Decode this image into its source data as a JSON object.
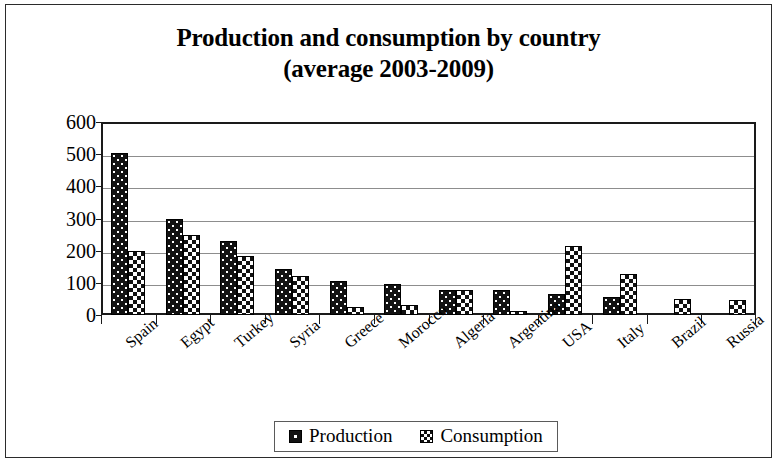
{
  "chart_data": {
    "type": "bar",
    "title": "Production and consumption by country (average 2003-2009)",
    "title_line1": "Production and consumption by country",
    "title_line2": "(average 2003-2009)",
    "xlabel": "",
    "ylabel": "000. tonn",
    "ylim": [
      0,
      600
    ],
    "ytick_values": [
      600,
      500,
      400,
      300,
      200,
      100,
      0
    ],
    "ytick_labels": [
      "600",
      "500",
      "400",
      "300",
      "200",
      "100",
      "0"
    ],
    "grid": true,
    "legend_position": "bottom",
    "categories": [
      "Spain",
      "Egypt",
      "Turkey",
      "Syria",
      "Greece",
      "Morocco",
      "Algeria",
      "Argentina",
      "USA",
      "Italy",
      "Brazil",
      "Russia"
    ],
    "series": [
      {
        "name": "Production",
        "pattern": "black-with-white-dots",
        "values": [
          505,
          300,
          230,
          142,
          105,
          95,
          78,
          78,
          65,
          55,
          0,
          0
        ]
      },
      {
        "name": "Consumption",
        "pattern": "checkerboard",
        "values": [
          198,
          250,
          185,
          120,
          25,
          30,
          78,
          12,
          215,
          128,
          50,
          48
        ]
      }
    ]
  },
  "legend": {
    "entries": [
      {
        "label": "Production",
        "swatch": "production-swatch-icon"
      },
      {
        "label": "Consumption",
        "swatch": "consumption-swatch-icon"
      }
    ]
  },
  "colors": {
    "axis": "#1a1a1a",
    "gridline": "#8d8d8d",
    "production_fill": "#121212",
    "consumption_fill": "#ffffff",
    "frame": "#2b2b2b",
    "background": "#ffffff"
  }
}
